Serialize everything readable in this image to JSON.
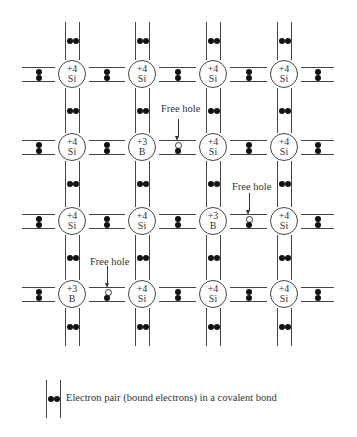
{
  "diagram": {
    "title": "",
    "lattice": {
      "columns_x": [
        72,
        142,
        213,
        284
      ],
      "rows_y": [
        74,
        147,
        221,
        294
      ],
      "atoms": [
        [
          {
            "charge": "+4",
            "symbol": "Si"
          },
          {
            "charge": "+4",
            "symbol": "Si"
          },
          {
            "charge": "+4",
            "symbol": "Si"
          },
          {
            "charge": "+4",
            "symbol": "Si"
          }
        ],
        [
          {
            "charge": "+4",
            "symbol": "Si"
          },
          {
            "charge": "+3",
            "symbol": "B"
          },
          {
            "charge": "+4",
            "symbol": "Si"
          },
          {
            "charge": "+4",
            "symbol": "Si"
          }
        ],
        [
          {
            "charge": "+4",
            "symbol": "Si"
          },
          {
            "charge": "+4",
            "symbol": "Si"
          },
          {
            "charge": "+3",
            "symbol": "B"
          },
          {
            "charge": "+4",
            "symbol": "Si"
          }
        ],
        [
          {
            "charge": "+3",
            "symbol": "B"
          },
          {
            "charge": "+4",
            "symbol": "Si"
          },
          {
            "charge": "+4",
            "symbol": "Si"
          },
          {
            "charge": "+4",
            "symbol": "Si"
          }
        ]
      ],
      "holes": [
        {
          "row": 1,
          "between_cols": [
            1,
            2
          ],
          "label": "Free hole"
        },
        {
          "row": 2,
          "between_cols": [
            2,
            3
          ],
          "label": "Free hole"
        },
        {
          "row": 3,
          "between_cols": [
            0,
            1
          ],
          "label": "Free hole"
        }
      ]
    },
    "labels": {
      "hole_1": "Free hole",
      "hole_2": "Free hole",
      "hole_3": "Free hole"
    },
    "legend": {
      "text": "Electron pair (bound electrons) in a covalent bond",
      "icon": "electron-pair-bond-icon"
    },
    "colors": {
      "line": "#444444",
      "electron": "#111111",
      "hole_fill": "#ffffff",
      "background": "#ffffff"
    }
  }
}
